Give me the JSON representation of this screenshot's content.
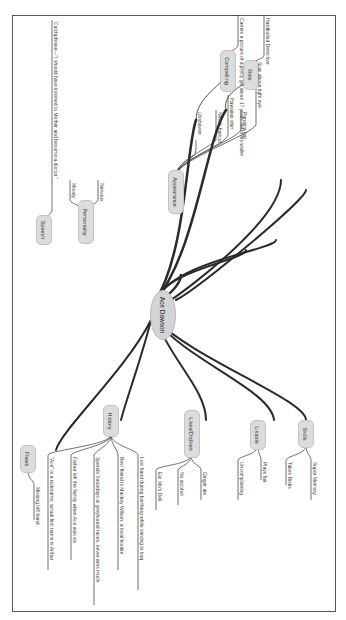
{
  "central": {
    "label": "Ace Dawson"
  },
  "branches": [
    {
      "label": "Role",
      "children": [
        "Hardboiled Detective"
      ]
    },
    {
      "label": "Compelling",
      "children": [
        "Carries a picture of a pretty girl about 17 years old in his wallet"
      ]
    },
    {
      "label": "Appearance",
      "children": [
        "Unshaven",
        "Needs haircut",
        "Hawaiian shirt",
        "Panama hat",
        "Scar above right eye"
      ]
    },
    {
      "label": "Personality",
      "children": [
        "Nervous",
        "Moody"
      ]
    },
    {
      "label": "Speech",
      "children": [
        "Catchphrase—\"I should have listened to Mother and become a doctor.\""
      ]
    },
    {
      "label": "Skills",
      "children": [
        "Super Memory",
        "Takes Risks"
      ]
    },
    {
      "label": "Likable",
      "children": [
        "Plays fair",
        "Uncomplaining"
      ]
    },
    {
      "label": "Likes/Dislikes",
      "children": [
        "Ginger ale",
        "No alcohol",
        "Eat Mo's Deli"
      ]
    },
    {
      "label": "History",
      "children": [
        "Lost hand during bombing while serving in Iraq",
        "Best friend is Mackey Wilson, a local bookie",
        "Spends Saturdays at greyhound races, never wins much",
        "Father left the family when Ace was six",
        "\"Ace\" is a nickname; actual first name is Arthur"
      ]
    },
    {
      "label": "Flaws",
      "children": [
        "Missing left hand"
      ]
    }
  ]
}
